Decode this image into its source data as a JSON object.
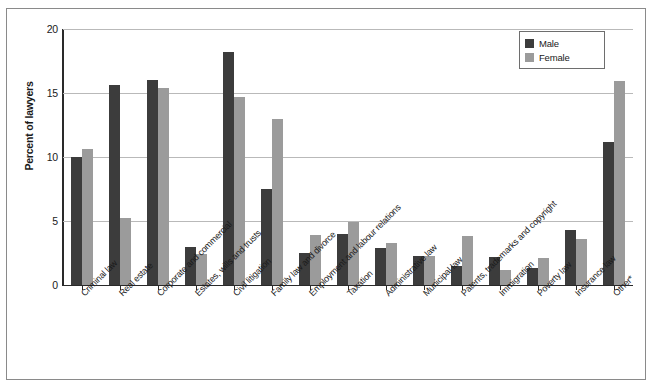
{
  "chart_data": {
    "type": "bar",
    "title": "",
    "xlabel": "",
    "ylabel": "Percent of lawyers",
    "ylim": [
      0,
      20
    ],
    "yticks": [
      0,
      5,
      10,
      15,
      20
    ],
    "grid": true,
    "legend_position": "top-right",
    "categories": [
      "Criminal law",
      "Real estate",
      "Corporate and commercial",
      "Estates, wills and trusts",
      "Civil litigation",
      "Family law and divorce",
      "Employment and labour relations",
      "Taxation",
      "Administrative law",
      "Municipal law",
      "Patents, trademarks and copyright",
      "Immigration",
      "Poverty law",
      "Insurance law",
      "Other*"
    ],
    "series": [
      {
        "name": "Male",
        "color": "#3c3c3c",
        "values": [
          10.0,
          15.6,
          16.0,
          3.0,
          18.2,
          7.5,
          2.5,
          4.0,
          2.9,
          2.3,
          1.5,
          2.2,
          1.3,
          4.3,
          11.2
        ]
      },
      {
        "name": "Female",
        "color": "#9b9b9b",
        "values": [
          10.6,
          5.2,
          15.4,
          2.4,
          14.7,
          13.0,
          3.9,
          4.9,
          3.3,
          2.3,
          3.8,
          1.2,
          2.1,
          3.6,
          15.9
        ]
      }
    ]
  },
  "legend": {
    "male_label": "Male",
    "female_label": "Female"
  },
  "axis": {
    "y_title": "Percent of lawyers"
  }
}
